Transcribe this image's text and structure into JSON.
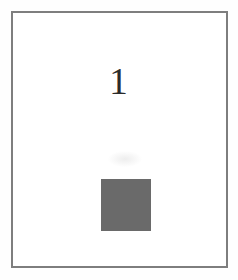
{
  "figure": {
    "number": "1",
    "frame": {
      "border_color": "#7e7e7e",
      "border_width_px": "2",
      "background_color": "#ffffff"
    },
    "swatch": {
      "label": "gray-square",
      "fill_color": "#6a6a6a",
      "width_px": "50",
      "height_px": "52"
    }
  },
  "page": {
    "background_color": "#fefefe",
    "width_px": "238",
    "height_px": "280"
  }
}
